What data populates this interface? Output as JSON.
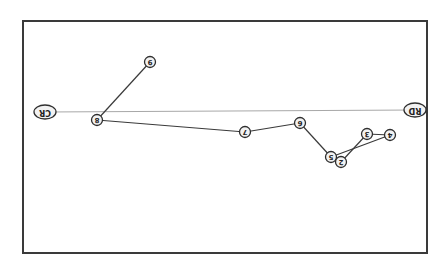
{
  "diagram": {
    "rotation_deg": 180,
    "frame": {
      "x": 23,
      "y": 21,
      "width": 404,
      "height": 232,
      "stroke": "#3a3a3a"
    },
    "axis": {
      "from": "CR",
      "to": "RD",
      "stroke": "#a8a8a8"
    },
    "nodes": [
      {
        "id": "CR",
        "label": "CR",
        "x": 45,
        "y": 112,
        "kind": "endpoint"
      },
      {
        "id": "RD",
        "label": "RD",
        "x": 415,
        "y": 110,
        "kind": "endpoint"
      },
      {
        "id": "n9",
        "label": "9",
        "x": 150,
        "y": 62,
        "kind": "point"
      },
      {
        "id": "n8",
        "label": "8",
        "x": 97,
        "y": 120,
        "kind": "point"
      },
      {
        "id": "n7",
        "label": "7",
        "x": 245,
        "y": 132,
        "kind": "point"
      },
      {
        "id": "n6",
        "label": "6",
        "x": 300,
        "y": 123,
        "kind": "point"
      },
      {
        "id": "n5",
        "label": "5",
        "x": 331,
        "y": 157,
        "kind": "point"
      },
      {
        "id": "n2",
        "label": "2",
        "x": 341,
        "y": 162,
        "kind": "point"
      },
      {
        "id": "n3",
        "label": "3",
        "x": 367,
        "y": 134,
        "kind": "point"
      },
      {
        "id": "n4",
        "label": "4",
        "x": 390,
        "y": 135,
        "kind": "point"
      }
    ],
    "edges": [
      [
        "n9",
        "n8"
      ],
      [
        "n8",
        "n7"
      ],
      [
        "n7",
        "n6"
      ],
      [
        "n6",
        "n5"
      ],
      [
        "n5",
        "n4"
      ],
      [
        "n4",
        "n3"
      ],
      [
        "n3",
        "n2"
      ],
      [
        "n2",
        "n5"
      ]
    ],
    "colors": {
      "background": "#ffffff",
      "edge": "#3a3a3a",
      "node_stroke": "#2e2e2e",
      "node_fill": "#f2f2f2",
      "label": "#222222"
    }
  }
}
